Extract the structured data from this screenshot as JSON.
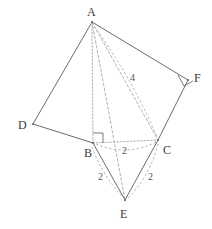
{
  "figure": {
    "canvas": {
      "width": 212,
      "height": 229
    },
    "colors": {
      "solid_edge": "#6b6b6b",
      "dashed_edge": "#a8a8a8",
      "dotted_edge": "#b0b0b0",
      "label_text": "#3a3a3a",
      "measure_text": "#555555",
      "background": "#ffffff"
    },
    "vertices": [
      {
        "name": "A",
        "label": "A",
        "x": 92,
        "y": 22,
        "label_x": 87,
        "label_y": 6
      },
      {
        "name": "B",
        "label": "B",
        "x": 93,
        "y": 143,
        "label_x": 84,
        "label_y": 147
      },
      {
        "name": "C",
        "label": "C",
        "x": 158,
        "y": 140,
        "label_x": 163,
        "label_y": 144
      },
      {
        "name": "D",
        "label": "D",
        "x": 33,
        "y": 124,
        "label_x": 18,
        "label_y": 119
      },
      {
        "name": "E",
        "label": "E",
        "x": 125,
        "y": 200,
        "label_x": 120,
        "label_y": 208
      },
      {
        "name": "F",
        "label": "F",
        "x": 188,
        "y": 80,
        "label_x": 194,
        "label_y": 72
      }
    ],
    "solid_edges": [
      {
        "name": "edge-A-D",
        "from": "A",
        "to": "D"
      },
      {
        "name": "edge-D-B",
        "from": "D",
        "to": "B"
      },
      {
        "name": "edge-A-F",
        "from": "A",
        "to": "F"
      },
      {
        "name": "edge-F-C",
        "from": "F",
        "to": "C"
      },
      {
        "name": "edge-B-E",
        "from": "B",
        "to": "E"
      },
      {
        "name": "edge-C-E",
        "from": "C",
        "to": "E"
      }
    ],
    "dotted_edges": [
      {
        "name": "edge-A-B",
        "from": "A",
        "to": "B"
      },
      {
        "name": "edge-B-C",
        "from": "B",
        "to": "C"
      }
    ],
    "dashed_edges": [
      {
        "name": "edge-A-C",
        "from": "A",
        "to": "C"
      },
      {
        "name": "edge-A-E",
        "from": "A",
        "to": "E"
      }
    ],
    "arcs": [
      {
        "name": "arc-B-C",
        "d": "M 96 144 Q 126 157 156 142"
      },
      {
        "name": "arc-B-E",
        "d": "M 92 147 Q 103 177 123 197"
      },
      {
        "name": "arc-C-E",
        "d": "M 158 144 Q 150 176 128 198"
      },
      {
        "name": "arc-A-C",
        "d": "M 94 26 Q 133 80 157 137"
      }
    ],
    "right_angles": [
      {
        "name": "right-angle-B",
        "d": "M 93 133 L 103 133 L 103 143"
      },
      {
        "name": "right-angle-F",
        "d": "M 178 75 L 184 86 L 193 81"
      }
    ],
    "measures": [
      {
        "name": "length-label-AC",
        "value": "4",
        "x": 130,
        "y": 73
      },
      {
        "name": "length-label-BC",
        "value": "2",
        "x": 122,
        "y": 146
      },
      {
        "name": "length-label-BE",
        "value": "2",
        "x": 98,
        "y": 172
      },
      {
        "name": "length-label-CE",
        "value": "2",
        "x": 148,
        "y": 172
      }
    ]
  }
}
